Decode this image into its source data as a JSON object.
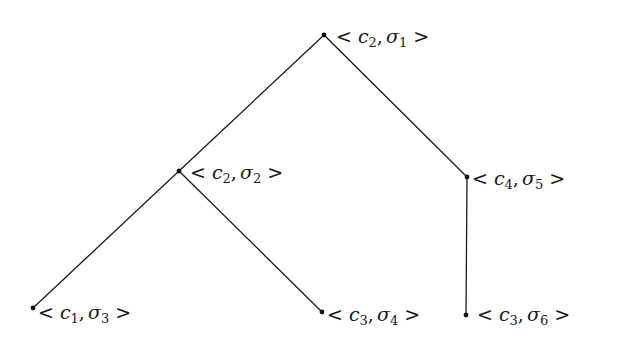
{
  "diagram": {
    "type": "tree",
    "nodes": [
      {
        "id": "n1",
        "c": "c",
        "c_sub": "2",
        "s": "σ",
        "s_sub": "1",
        "x": 324,
        "y": 35,
        "label_x": 336,
        "label_y": 27
      },
      {
        "id": "n2",
        "c": "c",
        "c_sub": "2",
        "s": "σ",
        "s_sub": "2",
        "x": 179,
        "y": 171,
        "label_x": 190,
        "label_y": 163
      },
      {
        "id": "n3",
        "c": "c",
        "c_sub": "4",
        "s": "σ",
        "s_sub": "5",
        "x": 467,
        "y": 177,
        "label_x": 472,
        "label_y": 169
      },
      {
        "id": "n4",
        "c": "c",
        "c_sub": "1",
        "s": "σ",
        "s_sub": "3",
        "x": 33,
        "y": 308,
        "label_x": 38,
        "label_y": 303
      },
      {
        "id": "n5",
        "c": "c",
        "c_sub": "3",
        "s": "σ",
        "s_sub": "4",
        "x": 322,
        "y": 312,
        "label_x": 327,
        "label_y": 305
      },
      {
        "id": "n6",
        "c": "c",
        "c_sub": "3",
        "s": "σ",
        "s_sub": "6",
        "x": 466,
        "y": 315,
        "label_x": 477,
        "label_y": 305
      }
    ],
    "edges": [
      {
        "from": "n1",
        "to": "n2"
      },
      {
        "from": "n1",
        "to": "n3"
      },
      {
        "from": "n2",
        "to": "n4"
      },
      {
        "from": "n2",
        "to": "n5"
      },
      {
        "from": "n3",
        "to": "n6"
      }
    ],
    "symbols": {
      "open": "<",
      "close": ">",
      "comma": ","
    },
    "labels": {
      "n1": "< c2, σ1 >",
      "n2": "< c2, σ2 >",
      "n3": "< c4, σ5 >",
      "n4": "< c1, σ3 >",
      "n5": "< c3, σ4 >",
      "n6": "< c3, σ6 >"
    }
  }
}
